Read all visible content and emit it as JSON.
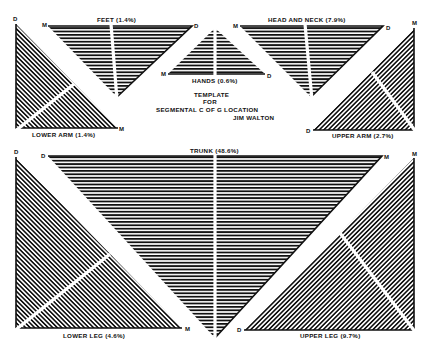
{
  "title": {
    "line1": "TEMPLATE",
    "line2": "FOR",
    "line3": "SEGMENTAL C OF G LOCATION",
    "author": "JIM WALTON"
  },
  "colors": {
    "ink": "#111111",
    "paper": "#ffffff"
  },
  "segments": [
    {
      "id": "lower-arm",
      "label": "LOWER ARM (1.4%)",
      "mass_percent": 1.4,
      "distal_label": "D",
      "proximal_label": "M",
      "hatch": "diagonal"
    },
    {
      "id": "feet",
      "label": "FEET (1.4%)",
      "mass_percent": 1.4,
      "distal_label": "D",
      "proximal_label": "M",
      "hatch": "horizontal"
    },
    {
      "id": "hands",
      "label": "HANDS (0.6%)",
      "mass_percent": 0.6,
      "distal_label": "D",
      "proximal_label": "M",
      "hatch": "horizontal"
    },
    {
      "id": "head-and-neck",
      "label": "HEAD AND NECK (7.9%)",
      "mass_percent": 7.9,
      "distal_label": "D",
      "proximal_label": "M",
      "hatch": "horizontal"
    },
    {
      "id": "upper-arm",
      "label": "UPPER ARM (2.7%)",
      "mass_percent": 2.7,
      "distal_label": "D",
      "proximal_label": "M",
      "hatch": "diagonal"
    },
    {
      "id": "trunk",
      "label": "TRUNK (48.6%)",
      "mass_percent": 48.6,
      "distal_label": "D",
      "proximal_label": "M",
      "hatch": "horizontal"
    },
    {
      "id": "lower-leg",
      "label": "LOWER LEG (4.6%)",
      "mass_percent": 4.6,
      "distal_label": "D",
      "proximal_label": "M",
      "hatch": "diagonal"
    },
    {
      "id": "upper-leg",
      "label": "UPPER LEG (9.7%)",
      "mass_percent": 9.7,
      "distal_label": "D",
      "proximal_label": "M",
      "hatch": "diagonal"
    }
  ]
}
